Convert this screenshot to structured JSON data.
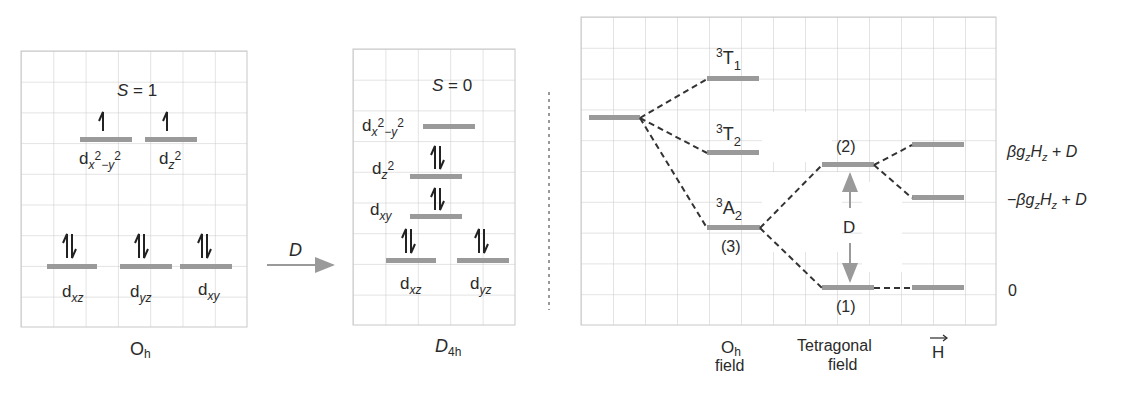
{
  "colors": {
    "grid": "#c8c8c8",
    "level": "#9a9a9a",
    "dash": "#333333",
    "arrow_gray": "#9a9a9a",
    "text": "#2a2a2a"
  },
  "panel_oh": {
    "spin_label": "S = 1",
    "group_label": "O",
    "group_sub": "h",
    "upper_levels": [
      {
        "orb": "d",
        "sub": "x",
        "sup1": "2",
        "mid": "−y",
        "sup2": "2",
        "electrons": "up"
      },
      {
        "orb": "d",
        "sub": "z",
        "sup1": "2",
        "electrons": "up"
      }
    ],
    "lower_levels": [
      {
        "orb": "d",
        "sub": "xz",
        "electrons": "pair"
      },
      {
        "orb": "d",
        "sub": "yz",
        "electrons": "pair"
      },
      {
        "orb": "d",
        "sub": "xy",
        "electrons": "pair"
      }
    ]
  },
  "transition": {
    "label": "D"
  },
  "panel_d4h": {
    "spin_label": "S = 0",
    "group_label": "D",
    "group_sub": "4h",
    "levels": [
      {
        "orb": "d",
        "sub": "x",
        "sup1": "2",
        "mid": "−y",
        "sup2": "2",
        "electrons": "none"
      },
      {
        "orb": "d",
        "sub": "z",
        "sup1": "2",
        "electrons": "pair"
      },
      {
        "orb": "d",
        "sub": "xy",
        "electrons": "pair"
      },
      {
        "orb": "d",
        "sub": "xz",
        "electrons": "pair"
      },
      {
        "orb": "d",
        "sub": "yz",
        "electrons": "pair"
      }
    ]
  },
  "panel_terms": {
    "terms": [
      {
        "sup": "3",
        "main": "T",
        "sub": "1"
      },
      {
        "sup": "3",
        "main": "T",
        "sub": "2"
      },
      {
        "sup": "3",
        "main": "A",
        "sub": "2",
        "degeneracy": "(3)"
      }
    ],
    "tetragonal_levels": [
      {
        "degeneracy": "(2)"
      },
      {
        "degeneracy": "(1)"
      }
    ],
    "splitting_label": "D",
    "energies": [
      {
        "pre": "",
        "beta": "β",
        "g": "g",
        "gsub": "z",
        "h": "H",
        "hsub": "z",
        "tail": " + D"
      },
      {
        "pre": "−",
        "beta": "β",
        "g": "g",
        "gsub": "z",
        "h": "H",
        "hsub": "z",
        "tail": " + D"
      },
      {
        "value": "0"
      }
    ],
    "axis_labels": {
      "oh_main": "O",
      "oh_sub": "h",
      "oh_line2": "field",
      "tet_line1": "Tetragonal",
      "tet_line2": "field",
      "field_vector": "H"
    }
  }
}
